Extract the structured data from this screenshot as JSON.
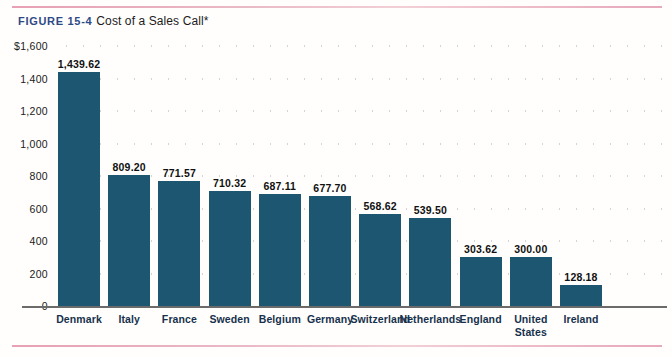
{
  "figure": {
    "label": "FIGURE 15-4",
    "title": "Cost of a Sales Call*",
    "label_color": "#2e4a86",
    "rule_color": "#e8a0b4"
  },
  "chart_data": {
    "type": "bar",
    "title": "Cost of a Sales Call*",
    "xlabel": "",
    "ylabel": "",
    "ylim": [
      0,
      1600
    ],
    "grid": true,
    "grid_style": "dotted-horizontal",
    "legend": "none",
    "bar_color": "#1d5670",
    "value_label_format": "comma-2dp",
    "y_ticks": [
      0,
      200,
      400,
      600,
      800,
      1000,
      1200,
      1400,
      1600
    ],
    "y_tick_labels": [
      "0",
      "200",
      "400",
      "600",
      "800",
      "1,000",
      "1,200",
      "1,400",
      "$1,600"
    ],
    "categories": [
      "Denmark",
      "Italy",
      "France",
      "Sweden",
      "Belgium",
      "Germany",
      "Switzerland",
      "Netherlands",
      "England",
      "United\nStates",
      "Ireland"
    ],
    "values": [
      1439.62,
      809.2,
      771.57,
      710.32,
      687.11,
      677.7,
      568.62,
      539.5,
      303.62,
      300.0,
      128.18
    ],
    "value_labels": [
      "1,439.62",
      "809.20",
      "771.57",
      "710.32",
      "687.11",
      "677.70",
      "568.62",
      "539.50",
      "303.62",
      "300.00",
      "128.18"
    ]
  }
}
